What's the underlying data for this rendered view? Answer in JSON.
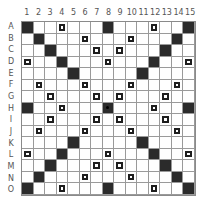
{
  "board": {
    "columns": [
      "1",
      "2",
      "3",
      "4",
      "5",
      "6",
      "7",
      "8",
      "9",
      "10",
      "11",
      "12",
      "13",
      "14",
      "15"
    ],
    "rows": [
      "A",
      "B",
      "C",
      "D",
      "E",
      "F",
      "G",
      "H",
      "I",
      "J",
      "K",
      "L",
      "M",
      "N",
      "O"
    ],
    "cells": [
      "B..b...B...b..B",
      ".B...b...b...B.",
      "..B...b.b...B..",
      "b..B...b...B..b",
      "....B.....B....",
      ".b...b...b...b.",
      "..b...b.b...b..",
      "B..b...S...b..B",
      "..b...b.b...b..",
      ".b...b...b...b.",
      "....B.....B....",
      "b..B...b...B..b",
      "..B...b.b...B..",
      ".B...b...b...B.",
      "B..b...B...b..B"
    ],
    "legend": {
      "B": "black-square",
      "b": "double-letter-box",
      "S": "center-star",
      ".": "empty"
    }
  }
}
